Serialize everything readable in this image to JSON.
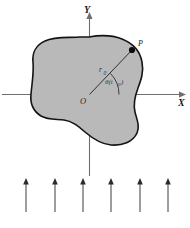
{
  "figure": {
    "title_caption": "",
    "colors": {
      "region_fill": "#b9b9b9",
      "region_stroke": "#141414",
      "axis_color": "#6f6f6f",
      "arrow_color": "#3c3c3c",
      "label_color": "#1a1a1a",
      "background": "#ffffff"
    },
    "axes": {
      "y_label": "Y",
      "x_label": "X",
      "origin_label": "O"
    },
    "annotations": {
      "point_label": "P",
      "radius_label": "r",
      "radius_subscript": "0",
      "angle_label": "θ(t",
      "angle_subscript": "0",
      "angle_label_close": ")"
    },
    "region": {
      "name": "closed-irregular-region",
      "fill": "#b9b9b9",
      "stroke": "#141414"
    },
    "field_arrows": {
      "name": "upward-vector-field",
      "count": 6,
      "direction": "up",
      "x_positions": [
        26,
        55,
        83,
        111,
        140,
        168
      ],
      "base_y": 212,
      "tip_y": 179
    },
    "caption": {
      "text": "",
      "visible": false
    }
  }
}
